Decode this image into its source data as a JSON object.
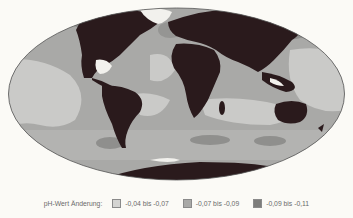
{
  "map": {
    "projection": "mollweide-world",
    "colors": {
      "land": "#2a1a1c",
      "ice": "#f5f4f0",
      "class_low": "#c9c9c7",
      "class_mid": "#a9a9a7",
      "class_high": "#8c8c8a",
      "outline": "#555555"
    }
  },
  "legend": {
    "title": "pH-Wert Änderung:",
    "items": [
      {
        "label": "-0,04 bis -0,07",
        "color": "#d4d4d2"
      },
      {
        "label": "-0,07 bis -0,09",
        "color": "#a9a9a7"
      },
      {
        "label": "-0,09 bis -0,11",
        "color": "#7d7d7b"
      }
    ]
  }
}
